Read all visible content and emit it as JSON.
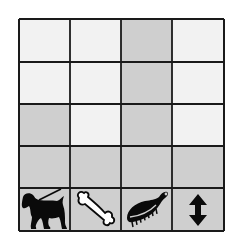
{
  "chart_data": {
    "type": "bar",
    "title": "",
    "xlabel": "",
    "ylabel": "",
    "ylim": [
      0,
      4
    ],
    "grid": true,
    "legend": "none",
    "categories": [
      "dog-walking",
      "bone",
      "brush",
      "up-down-arrow"
    ],
    "category_icons": [
      "dog-walking-icon",
      "bone-icon",
      "brush-icon",
      "up-down-arrow-icon"
    ],
    "values": [
      2,
      1,
      4,
      1
    ]
  },
  "colors": {
    "filled": "#cfcfcf",
    "empty": "#f2f2f2",
    "icon_row": "#cfcfcf",
    "grid_line": "#1a1a1a",
    "icon": "#0a0a0a",
    "bone_fill": "#ffffff"
  }
}
